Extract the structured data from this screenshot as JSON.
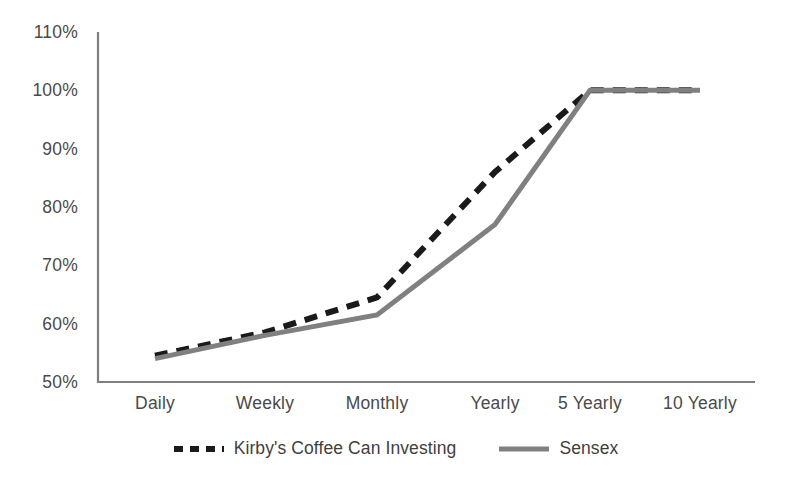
{
  "chart_data": {
    "type": "line",
    "title": "",
    "subtitle": "",
    "xlabel": "",
    "ylabel": "",
    "categories": [
      "Daily",
      "Weekly",
      "Monthly",
      "Yearly",
      "5 Yearly",
      "10 Yearly"
    ],
    "ylim": [
      50,
      110
    ],
    "y_ticks": [
      50,
      60,
      70,
      80,
      90,
      100,
      110
    ],
    "y_tick_labels": [
      "50%",
      "60%",
      "70%",
      "80%",
      "90%",
      "100%",
      "110%"
    ],
    "grid": false,
    "legend_position": "bottom",
    "series": [
      {
        "name": "Kirby's Coffee Can Investing",
        "values": [
          54.5,
          58.5,
          64.5,
          86.0,
          100.0,
          100.0
        ],
        "color": "#1a1a1a",
        "style": "dashed",
        "width": 6
      },
      {
        "name": "Sensex",
        "values": [
          54.0,
          58.0,
          61.5,
          77.0,
          100.0,
          100.0
        ],
        "color": "#808080",
        "style": "solid",
        "width": 5
      }
    ],
    "axis_color": "#7f7f7f"
  },
  "legend": {
    "items": [
      {
        "label": "Kirby's Coffee Can Investing",
        "swatch": "dashed-line-swatch"
      },
      {
        "label": "Sensex",
        "swatch": "solid-line-swatch"
      }
    ]
  }
}
